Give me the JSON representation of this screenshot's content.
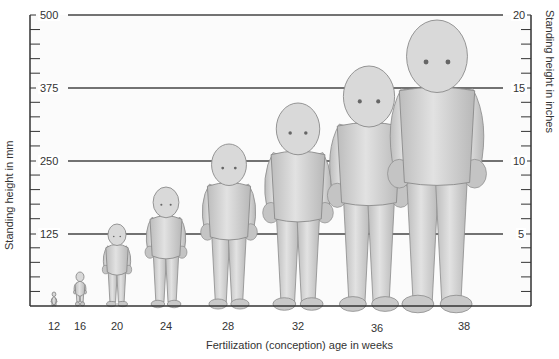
{
  "chart_data": {
    "type": "illustration",
    "title": "",
    "xlabel": "Fertilization (conception) age in weeks",
    "ylabel_left": "Standing height in mm",
    "ylabel_right": "Standing height in inches",
    "y_left_ticks": [
      "500",
      "375",
      "250",
      "125"
    ],
    "y_right_ticks": [
      "20",
      "15",
      "10",
      "5"
    ],
    "y_left_range": [
      0,
      500
    ],
    "y_right_range": [
      0,
      20
    ],
    "grid": true,
    "categories": [
      "12",
      "16",
      "20",
      "24",
      "28",
      "32",
      "36",
      "38"
    ],
    "values_mm": [
      56,
      140,
      190,
      230,
      270,
      300,
      350,
      500
    ],
    "series": [
      {
        "name": "Standing height (mm, approx.)",
        "values": [
          56,
          140,
          190,
          230,
          270,
          300,
          350,
          500
        ]
      }
    ]
  },
  "figures": [
    {
      "week": "12",
      "cx": 54,
      "top": 292
    },
    {
      "week": "16",
      "cx": 80,
      "top": 272
    },
    {
      "week": "20",
      "cx": 117,
      "top": 224
    },
    {
      "week": "24",
      "cx": 166,
      "top": 187
    },
    {
      "week": "28",
      "cx": 229,
      "top": 144
    },
    {
      "week": "32",
      "cx": 298,
      "top": 103
    },
    {
      "week": "36",
      "cx": 369,
      "top": 66
    },
    {
      "week": "38",
      "cx": 437,
      "top": 20
    }
  ],
  "colors": {
    "axis": "#333333",
    "grid": "#444444",
    "figure_fill": "#cfcfcf",
    "figure_stroke": "#8a8a8a",
    "background": "#ffffff"
  }
}
